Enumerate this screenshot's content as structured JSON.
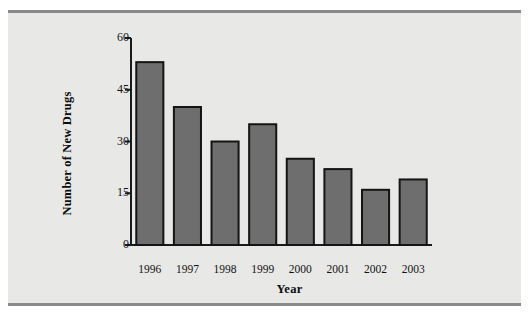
{
  "chart_data": {
    "type": "bar",
    "title": "",
    "xlabel": "Year",
    "ylabel": "Number of New Drugs",
    "categories": [
      "1996",
      "1997",
      "1998",
      "1999",
      "2000",
      "2001",
      "2002",
      "2003"
    ],
    "values": [
      53,
      40,
      30,
      35,
      25,
      22,
      16,
      19
    ],
    "ylim": [
      0,
      60
    ],
    "yticks": [
      0,
      15,
      30,
      45,
      60
    ],
    "ytick_labels": [
      "0",
      "15",
      "30",
      "45",
      "60"
    ],
    "grid": false,
    "legend": false,
    "legend_position": "none",
    "bar_fill_color": "#6e6e6e",
    "bar_edge_color": "#141414",
    "axis_color": "#1a1a1a",
    "plot_background_color": "#e8e8e6",
    "page_background_color": "#ffffff",
    "rule_color": "#8a8a8a"
  }
}
